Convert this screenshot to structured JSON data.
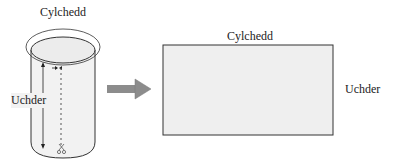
{
  "cylinder": {
    "circumference_label": "Cylchedd",
    "height_label": "Uchder"
  },
  "arrow": {
    "direction": "right",
    "color": "#8c8c8c"
  },
  "rectangle": {
    "top_label": "Cylchedd",
    "side_label": "Uchder",
    "fill": "#efefef"
  },
  "icons": {
    "scissors": "scissors-icon"
  }
}
